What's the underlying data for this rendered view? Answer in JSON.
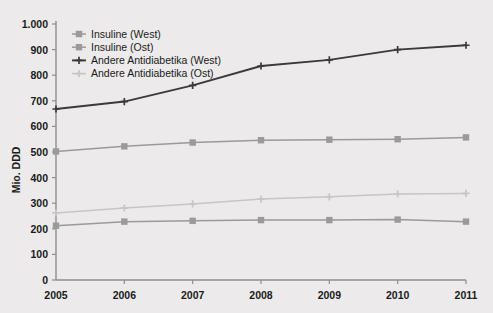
{
  "chart_data": {
    "type": "line",
    "title": "",
    "xlabel": "",
    "ylabel": "Mio. DDD",
    "x": [
      2005,
      2006,
      2007,
      2008,
      2009,
      2010,
      2011
    ],
    "categories": [
      "2005",
      "2006",
      "2007",
      "2008",
      "2009",
      "2010",
      "2011"
    ],
    "xtick_labels": [
      "2005",
      "2006",
      "2007",
      "2008",
      "2009",
      "2010",
      "2011"
    ],
    "ytick_labels": [
      "0",
      "100",
      "200",
      "300",
      "400",
      "500",
      "600",
      "700",
      "800",
      "900",
      "1.000"
    ],
    "ytick_values": [
      0,
      100,
      200,
      300,
      400,
      500,
      600,
      700,
      800,
      900,
      1000
    ],
    "ylim": [
      0,
      1000
    ],
    "xlim": [
      2005,
      2011
    ],
    "grid": false,
    "legend_position": "top-left",
    "series": [
      {
        "name": "Insuline (West)",
        "color": "#9a9a9a",
        "marker": "square",
        "values": [
          502,
          522,
          537,
          546,
          548,
          550,
          557
        ]
      },
      {
        "name": "Insuline (Ost)",
        "color": "#9a9a9a",
        "marker": "square",
        "values": [
          212,
          228,
          231,
          234,
          234,
          236,
          228
        ]
      },
      {
        "name": "Andere Antidiabetika (West)",
        "color": "#3a3a3a",
        "marker": "plus",
        "values": [
          668,
          697,
          760,
          836,
          860,
          900,
          917
        ]
      },
      {
        "name": "Andere Antidiabetika (Ost)",
        "color": "#c6c6c6",
        "marker": "plus",
        "values": [
          262,
          281,
          297,
          316,
          325,
          336,
          338
        ]
      }
    ]
  },
  "legend": {
    "items": [
      {
        "label": "Insuline (West)"
      },
      {
        "label": "Insuline (Ost)"
      },
      {
        "label": "Andere Antidiabetika (West)"
      },
      {
        "label": "Andere Antidiabetika (Ost)"
      }
    ]
  },
  "axes": {
    "y_title": "Mio. DDD"
  },
  "colors": {
    "background": "#eceaea",
    "axis": "#8e8e8e",
    "text": "#1a1a1a",
    "series_dark": "#3a3a3a",
    "series_mid": "#9a9a9a",
    "series_light": "#c6c6c6"
  }
}
